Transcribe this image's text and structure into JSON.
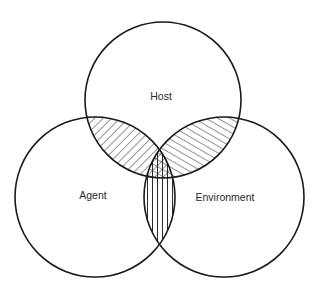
{
  "diagram": {
    "type": "venn",
    "sets": [
      {
        "id": "host",
        "label": "Host",
        "cx": 163,
        "cy": 100,
        "r": 78,
        "label_x": 161,
        "label_y": 97
      },
      {
        "id": "agent",
        "label": "Agent",
        "cx": 95,
        "cy": 197,
        "r": 80,
        "label_x": 93,
        "label_y": 196
      },
      {
        "id": "environment",
        "label": "Environment",
        "cx": 224,
        "cy": 197,
        "r": 80,
        "label_x": 225,
        "label_y": 198
      }
    ],
    "overlaps": [
      {
        "sets": [
          "host",
          "agent"
        ],
        "fill": "diagonal-hatch-down-right"
      },
      {
        "sets": [
          "host",
          "environment"
        ],
        "fill": "diagonal-hatch-up-right"
      },
      {
        "sets": [
          "agent",
          "environment"
        ],
        "fill": "vertical-hatch"
      },
      {
        "sets": [
          "host",
          "agent",
          "environment"
        ],
        "fill": "cross-hatch"
      }
    ],
    "colors": {
      "stroke": "#1a1a1a",
      "hatch": "#2a2a2a",
      "background": "#ffffff"
    }
  }
}
